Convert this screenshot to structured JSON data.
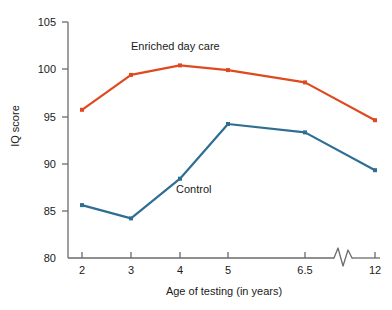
{
  "chart_data": {
    "type": "line",
    "title": "",
    "xlabel": "Age of testing (in years)",
    "ylabel": "IQ score",
    "categories": [
      "2",
      "3",
      "4",
      "5",
      "6.5",
      "12"
    ],
    "x_tick_labels": [
      "2",
      "3",
      "4",
      "5",
      "6.5",
      "12"
    ],
    "y_tick_labels": [
      "80",
      "85",
      "90",
      "95",
      "100",
      "105"
    ],
    "y_ticks": [
      80,
      85,
      90,
      95,
      100,
      105
    ],
    "ylim": [
      80,
      105
    ],
    "grid": false,
    "legend_position": "inline-annotation",
    "axis_break": {
      "present": true,
      "between": [
        "6.5",
        "12"
      ],
      "axis": "x",
      "symbol": "zigzag"
    },
    "series": [
      {
        "name": "Enriched day care",
        "color": "#E0491F",
        "label_text": "Enriched day care",
        "values": [
          95.7,
          99.4,
          100.4,
          99.9,
          98.6,
          94.6
        ]
      },
      {
        "name": "Control",
        "color": "#2E6E94",
        "label_text": "Control",
        "values": [
          85.6,
          84.2,
          88.4,
          94.2,
          93.3,
          89.3
        ]
      }
    ],
    "axis_color": "#6b6b6b",
    "text_color": "#1a1a1a",
    "background": "#ffffff"
  },
  "annotations": {
    "enriched_label": "Enriched day care",
    "control_label": "Control"
  },
  "axes": {
    "y_title": "IQ score",
    "x_title": "Age of testing (in years)"
  }
}
